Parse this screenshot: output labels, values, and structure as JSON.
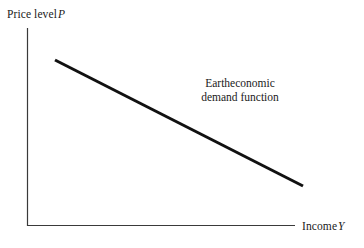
{
  "figure": {
    "width": 364,
    "height": 248,
    "background_color": "#ffffff"
  },
  "axes": {
    "y_axis": {
      "label_prefix": "Price level",
      "label_variable": "P",
      "line_color": "#3a3a3a",
      "line_width": 1.2
    },
    "x_axis": {
      "label_prefix": "Income",
      "label_variable": "Y",
      "line_color": "#3a3a3a",
      "line_width": 1.2
    }
  },
  "annotation": {
    "line1": "Eartheconomic",
    "line2": "demand function"
  },
  "chart_data": {
    "type": "line",
    "title": "",
    "xlabel": "Income Y",
    "ylabel": "Price level P",
    "legend": [],
    "grid": false,
    "series": [
      {
        "name": "Eartheconomic demand function",
        "color": "#111111",
        "line_width": 3,
        "x": [
          55,
          303
        ],
        "y": [
          60,
          186
        ],
        "description": "Downward-sloping straight line representing a negative relationship between income Y and price level P"
      }
    ],
    "xlim": [
      27,
      295
    ],
    "ylim": [
      226,
      28
    ],
    "tick_labels_x": [],
    "tick_labels_y": [],
    "annotations": [
      {
        "text": "Eartheconomic demand function",
        "x": 240,
        "y": 92
      }
    ]
  }
}
